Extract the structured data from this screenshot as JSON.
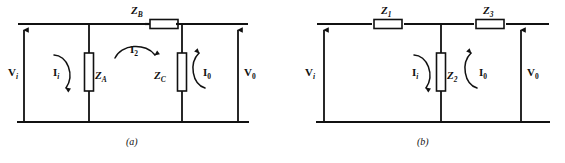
{
  "figure": {
    "background_color": "#ffffff",
    "line_color": "#111111",
    "component_fill": "#ffffff"
  },
  "diagram_a": {
    "caption": "(a)",
    "components": [
      {
        "name": "Z_B",
        "symbol": "Z",
        "subscript": "B",
        "orientation": "horizontal",
        "label_x": 133,
        "label_y": 8
      },
      {
        "name": "Z_A",
        "symbol": "Z",
        "subscript": "A",
        "orientation": "vertical",
        "label_x": 95,
        "label_y": 76
      },
      {
        "name": "Z_C",
        "symbol": "Z",
        "subscript": "C",
        "orientation": "vertical",
        "label_x": 156,
        "label_y": 76
      }
    ],
    "voltages": [
      {
        "name": "V_i",
        "symbol": "V",
        "subscript": "i",
        "italic_sub": true,
        "label_x": 12,
        "label_y": 73
      },
      {
        "name": "V_0",
        "symbol": "V",
        "subscript": "0",
        "italic_sub": false,
        "label_x": 243,
        "label_y": 73
      }
    ],
    "currents": [
      {
        "name": "I_i",
        "symbol": "I",
        "subscript": "i",
        "italic_sub": true,
        "label_x": 55,
        "label_y": 73
      },
      {
        "name": "I_2",
        "symbol": "I",
        "subscript": "2",
        "italic_sub": false,
        "label_x": 133,
        "label_y": 49
      },
      {
        "name": "I_0",
        "symbol": "I",
        "subscript": "0",
        "italic_sub": false,
        "label_x": 194,
        "label_y": 73
      }
    ]
  },
  "diagram_b": {
    "caption": "(b)",
    "components": [
      {
        "name": "Z_1",
        "symbol": "Z",
        "subscript": "1",
        "orientation": "horizontal",
        "label_x": 385,
        "label_y": 8
      },
      {
        "name": "Z_3",
        "symbol": "Z",
        "subscript": "3",
        "orientation": "horizontal",
        "label_x": 487,
        "label_y": 8
      },
      {
        "name": "Z_2",
        "symbol": "Z",
        "subscript": "2",
        "orientation": "vertical",
        "label_x": 458,
        "label_y": 76
      }
    ],
    "voltages": [
      {
        "name": "V_i",
        "symbol": "V",
        "subscript": "i",
        "italic_sub": true,
        "label_x": 328,
        "label_y": 73
      },
      {
        "name": "V_0",
        "symbol": "V",
        "subscript": "0",
        "italic_sub": false,
        "label_x": 525,
        "label_y": 73
      }
    ],
    "currents": [
      {
        "name": "I_i",
        "symbol": "I",
        "subscript": "i",
        "italic_sub": true,
        "label_x": 415,
        "label_y": 73
      },
      {
        "name": "I_0",
        "symbol": "I",
        "subscript": "0",
        "italic_sub": false,
        "label_x": 480,
        "label_y": 73
      }
    ]
  },
  "labels": {
    "a_ZB": "Z",
    "a_ZB_sub": "B",
    "a_ZA": "Z",
    "a_ZA_sub": "A",
    "a_ZC": "Z",
    "a_ZC_sub": "C",
    "a_Vi": "V",
    "a_Vi_sub": "i",
    "a_V0": "V",
    "a_V0_sub": "0",
    "a_Ii": "I",
    "a_Ii_sub": "i",
    "a_I2": "I",
    "a_I2_sub": "2",
    "a_I0": "I",
    "a_I0_sub": "0",
    "a_caption": "(a)",
    "b_Z1": "Z",
    "b_Z1_sub": "1",
    "b_Z3": "Z",
    "b_Z3_sub": "3",
    "b_Z2": "Z",
    "b_Z2_sub": "2",
    "b_Vi": "V",
    "b_Vi_sub": "i",
    "b_V0": "V",
    "b_V0_sub": "0",
    "b_Ii": "I",
    "b_Ii_sub": "i",
    "b_I0": "I",
    "b_I0_sub": "0",
    "b_caption": "(b)"
  }
}
